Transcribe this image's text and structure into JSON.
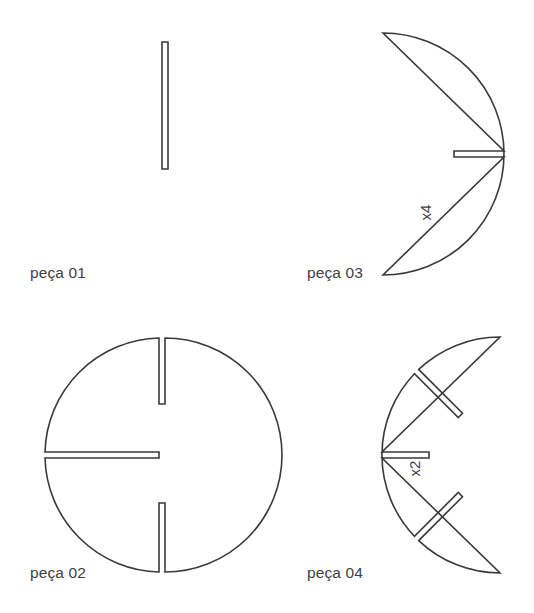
{
  "sheet": {
    "width": 534,
    "height": 613,
    "background": "#ffffff",
    "stroke_color": "#3a3a3a",
    "fill_color": "#ffffff",
    "text_color": "#3f3f3f",
    "stroke_width": 1.6,
    "title": "Diagrama de peças de encaixe"
  },
  "pieces": [
    {
      "id": "peca-01",
      "label": "peça 01",
      "quantity_label": "",
      "shape": "full-circle",
      "center": {
        "x": 165,
        "y": 153
      },
      "radius": 111,
      "label_pos": {
        "x": 30,
        "y": 264
      },
      "slots": [
        {
          "name": "bottom-vertical-slot",
          "from_edge": "bottom",
          "angle_deg": 90,
          "depth": 127,
          "width": 6
        }
      ]
    },
    {
      "id": "peca-02",
      "label": "peça 02",
      "quantity_label": "",
      "shape": "full-circle",
      "center": {
        "x": 162,
        "y": 455
      },
      "radius": 117,
      "label_pos": {
        "x": 30,
        "y": 564
      },
      "slots": [
        {
          "name": "top-vertical-slot",
          "from_edge": "top",
          "angle_deg": 270,
          "depth": 69,
          "width": 6
        },
        {
          "name": "left-horizontal-slot",
          "from_edge": "left",
          "angle_deg": 180,
          "depth": 114,
          "width": 6
        },
        {
          "name": "bottom-vertical-slot",
          "from_edge": "bottom",
          "angle_deg": 90,
          "depth": 66,
          "width": 6
        }
      ]
    },
    {
      "id": "peca-03",
      "label": "peça 03",
      "quantity_label": "x4",
      "shape": "half-disc-right",
      "center": {
        "x": 383,
        "y": 154
      },
      "radius": 121,
      "label_pos": {
        "x": 307,
        "y": 264
      },
      "qty_pos": {
        "x": 418,
        "y": 204
      },
      "slots": [
        {
          "name": "center-horizontal-slot",
          "from_edge": "flat-left",
          "angle_deg": 0,
          "depth": 50,
          "width": 6
        }
      ]
    },
    {
      "id": "peca-04",
      "label": "peça 04",
      "quantity_label": "x2",
      "shape": "half-disc-left",
      "center": {
        "x": 500,
        "y": 455
      },
      "radius": 118,
      "label_pos": {
        "x": 307,
        "y": 564
      },
      "qty_pos": {
        "x": 407,
        "y": 460
      },
      "slots": [
        {
          "name": "upper-diagonal-slot",
          "from_edge": "arc",
          "angle_deg": 135,
          "depth": 62,
          "width": 6
        },
        {
          "name": "center-horizontal-slot",
          "from_edge": "flat-right",
          "angle_deg": 180,
          "depth": 47,
          "width": 6
        },
        {
          "name": "lower-diagonal-slot",
          "from_edge": "arc",
          "angle_deg": 225,
          "depth": 62,
          "width": 6
        }
      ]
    }
  ]
}
